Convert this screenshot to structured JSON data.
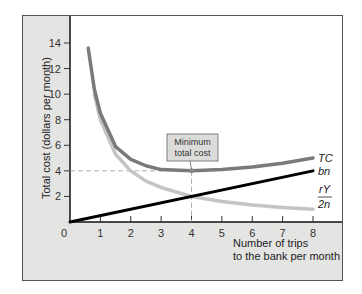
{
  "chart_data": {
    "type": "line",
    "title": "",
    "xlabel": "Number of trips to the bank per month",
    "xlabel_lines": [
      "Number of trips",
      "to the bank per month"
    ],
    "ylabel": "Total cost (dollars per month)",
    "xlim": [
      0,
      8
    ],
    "ylim": [
      0,
      14
    ],
    "x_ticks": [
      0,
      1,
      2,
      3,
      4,
      5,
      6,
      7,
      8
    ],
    "y_ticks": [
      2,
      4,
      6,
      8,
      10,
      12,
      14
    ],
    "grid": false,
    "legend": "inline labels at right end of curves",
    "series": [
      {
        "name": "TC",
        "label": "TC",
        "description": "Total cost = bn + rY/2n",
        "color": "#7a7a7a",
        "x": [
          0.6,
          0.8,
          1,
          1.5,
          2,
          2.5,
          3,
          4,
          5,
          6,
          7,
          8
        ],
        "y": [
          13.6,
          10.4,
          8.5,
          5.9,
          4.9,
          4.4,
          4.1,
          4.0,
          4.1,
          4.3,
          4.6,
          5.0
        ]
      },
      {
        "name": "bn",
        "label": "bn",
        "description": "Brokerage cost, linear in trips",
        "color": "#000000",
        "x": [
          0,
          8
        ],
        "y": [
          0,
          4
        ]
      },
      {
        "name": "rY/2n",
        "label_num": "rY",
        "label_den": "2n",
        "description": "Forgone interest cost",
        "color": "#c4c4c4",
        "x": [
          0.8,
          1,
          1.5,
          2,
          2.5,
          3,
          4,
          5,
          6,
          7,
          8
        ],
        "y": [
          10.0,
          8.0,
          5.3,
          4.0,
          3.2,
          2.7,
          2.0,
          1.6,
          1.33,
          1.14,
          1.0
        ]
      }
    ],
    "annotations": [
      {
        "text_lines": [
          "Minimum",
          "total cost"
        ],
        "point": [
          4,
          4
        ],
        "dashed_guides": true
      }
    ]
  }
}
